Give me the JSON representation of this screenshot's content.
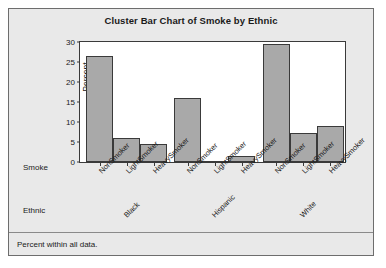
{
  "chart_data": {
    "type": "bar",
    "title": "Cluster Bar Chart of Smoke by Ethnic",
    "xlabel": "Ethnic",
    "ylabel": "Percent",
    "ylim": [
      0,
      30
    ],
    "yticks": [
      0,
      5,
      10,
      15,
      20,
      25,
      30
    ],
    "grid": false,
    "legend": "none",
    "group_axis_label": "Ethnic",
    "category_axis_label": "Smoke",
    "categories": [
      "NonSmoker",
      "LightSmoker",
      "HeavySmoker"
    ],
    "groups": [
      "Black",
      "Hispanic",
      "White"
    ],
    "series": [
      {
        "name": "Black",
        "values": [
          26.4,
          6.0,
          4.4
        ]
      },
      {
        "name": "Hispanic",
        "values": [
          16.1,
          0.2,
          1.6
        ]
      },
      {
        "name": "White",
        "values": [
          29.5,
          7.3,
          8.9
        ]
      }
    ],
    "footnote": "Percent within all data.",
    "bar_color": "#a9a9a9",
    "bar_border_color": "#3a3a3a",
    "panel_color": "#e9e9e9",
    "plot_background": "#ffffff"
  }
}
